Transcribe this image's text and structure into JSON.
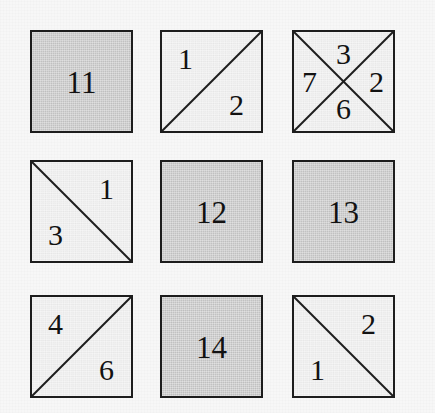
{
  "figure": {
    "type": "grid-diagram",
    "rows": 3,
    "columns": 3,
    "background_color": "#f7f7f7",
    "filled_color": "#c2c2c2",
    "empty_color": "#ececec",
    "line_color": "#1d1d1d"
  },
  "cells": [
    {
      "row": 0,
      "col": 0,
      "style": "filled",
      "diagonals": "none",
      "labels": {
        "center": "11"
      }
    },
    {
      "row": 0,
      "col": 1,
      "style": "empty",
      "diagonals": "anti",
      "labels": {
        "top_left": "1",
        "bottom_right": "2"
      }
    },
    {
      "row": 0,
      "col": 2,
      "style": "empty",
      "diagonals": "both",
      "labels": {
        "north": "3",
        "west": "7",
        "east": "2",
        "south": "6"
      }
    },
    {
      "row": 1,
      "col": 0,
      "style": "empty",
      "diagonals": "main",
      "labels": {
        "top_right": "1",
        "bottom_left": "3"
      }
    },
    {
      "row": 1,
      "col": 1,
      "style": "filled",
      "diagonals": "none",
      "labels": {
        "center": "12"
      }
    },
    {
      "row": 1,
      "col": 2,
      "style": "filled",
      "diagonals": "none",
      "labels": {
        "center": "13"
      }
    },
    {
      "row": 2,
      "col": 0,
      "style": "empty",
      "diagonals": "anti",
      "labels": {
        "top_left": "4",
        "bottom_right": "6"
      }
    },
    {
      "row": 2,
      "col": 1,
      "style": "filled",
      "diagonals": "none",
      "labels": {
        "center": "14"
      }
    },
    {
      "row": 2,
      "col": 2,
      "style": "empty",
      "diagonals": "main",
      "labels": {
        "top_right": "2",
        "bottom_left": "1"
      }
    }
  ]
}
